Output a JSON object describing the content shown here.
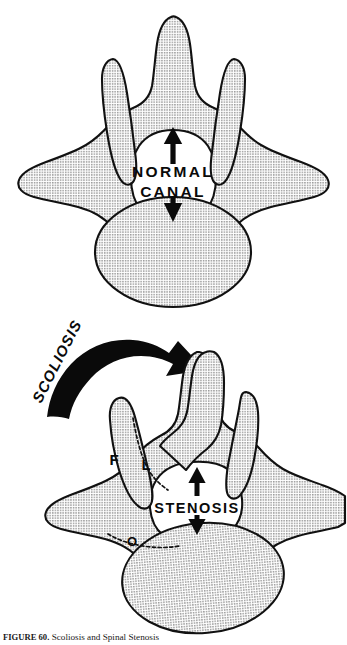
{
  "figure": {
    "panels": [
      {
        "id": "normal",
        "name": "normal-vertebra-panel",
        "description": "Symmetric axial view of a normal vertebra with an open spinal canal",
        "labels": [
          {
            "name": "normal-canal-line-1",
            "text": "NORMAL"
          },
          {
            "name": "normal-canal-line-2",
            "text": "CANAL"
          }
        ],
        "annotations": [
          {
            "name": "canal-arrow-up",
            "icon": "arrow-up-icon"
          },
          {
            "name": "canal-arrow-down",
            "icon": "arrow-down-icon"
          }
        ]
      },
      {
        "id": "scoliotic",
        "name": "scoliotic-vertebra-panel",
        "description": "Rotated asymmetric vertebra in scoliosis showing a narrowed, stenotic canal",
        "labels": [
          {
            "name": "scoliosis-label",
            "text": "SCOLIOSIS"
          },
          {
            "name": "stenosis-label",
            "text": "STENOSIS"
          },
          {
            "name": "facet-label",
            "text": "F"
          },
          {
            "name": "lamina-label",
            "text": "L"
          },
          {
            "name": "osteophyte-label",
            "text": "O"
          }
        ],
        "annotations": [
          {
            "name": "scoliosis-rotation-arrow",
            "icon": "curved-arrow-right-icon"
          },
          {
            "name": "stenosis-arrow-up",
            "icon": "arrow-up-icon"
          },
          {
            "name": "stenosis-arrow-down",
            "icon": "arrow-down-icon"
          }
        ]
      }
    ],
    "caption": {
      "figure_number": "FIGURE 60.",
      "text": "Scoliosis and Spinal Stenosis"
    },
    "colors": {
      "ink": "#111111",
      "stipple": "#8c8c8c",
      "background": "#ffffff"
    }
  }
}
